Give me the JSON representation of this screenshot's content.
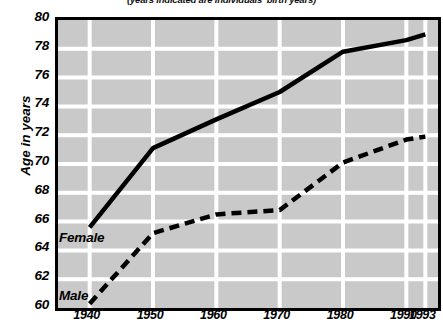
{
  "chart_data": {
    "type": "line",
    "title": "",
    "subtitle": "(years indicated are individuals' birth years)",
    "xlabel": "",
    "ylabel": "Age in years",
    "x": [
      1940,
      1950,
      1960,
      1970,
      1980,
      1990,
      1993
    ],
    "xticklabels": [
      "1940",
      "1950",
      "1960",
      "1970",
      "1980",
      "1990",
      "1993"
    ],
    "yticklabels": [
      "60",
      "62",
      "64",
      "66",
      "68",
      "70",
      "72",
      "74",
      "76",
      "78",
      "80"
    ],
    "yticks": [
      60,
      62,
      64,
      66,
      68,
      70,
      72,
      74,
      76,
      78,
      80
    ],
    "xlim": [
      1935,
      1995
    ],
    "ylim": [
      60,
      80
    ],
    "grid": true,
    "grid_color": "#ffffff",
    "plot_background": "#c9c9c9",
    "frame_color": "#000000",
    "legend_position": "inline-left",
    "series": [
      {
        "name": "Female",
        "style": "solid",
        "color": "#000000",
        "values": [
          65.6,
          71.1,
          73.1,
          75.0,
          77.8,
          78.6,
          79.0
        ]
      },
      {
        "name": "Male",
        "style": "dashed",
        "color": "#000000",
        "values": [
          60.3,
          65.2,
          66.5,
          66.8,
          70.1,
          71.7,
          71.9
        ]
      }
    ],
    "annotations": [
      {
        "text": "Female",
        "x": 1940,
        "y": 66.9
      },
      {
        "text": "Male",
        "x": 1940,
        "y": 62.9
      }
    ]
  },
  "axis": {
    "y_title": "Age in years"
  }
}
